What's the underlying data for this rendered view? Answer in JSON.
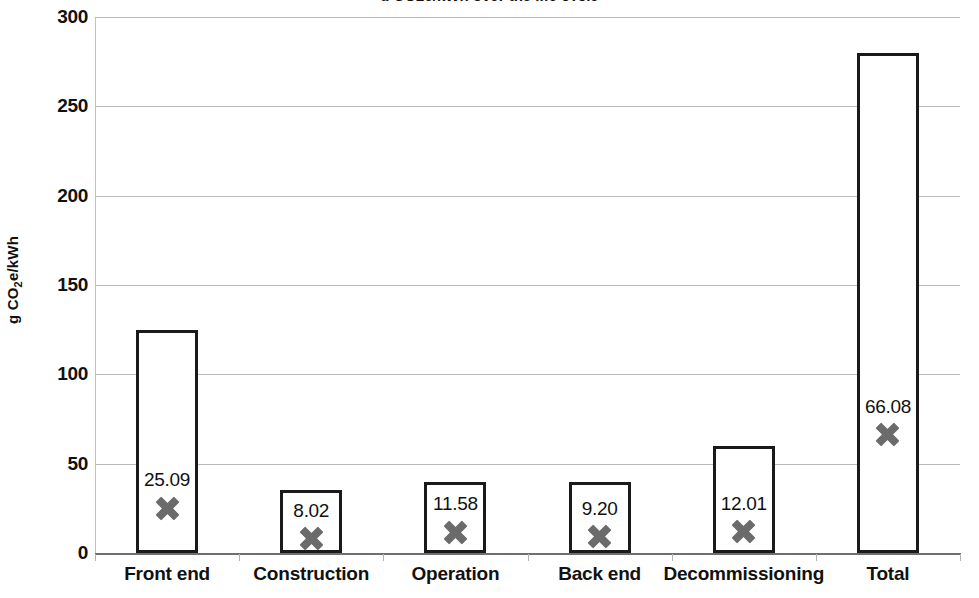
{
  "chart_data": {
    "type": "bar",
    "title": "g CO2e/kWh over the life cycle",
    "title_visible": false,
    "categories": [
      "Front end",
      "Construction",
      "Operation",
      "Back end",
      "Decommissioning",
      "Total"
    ],
    "series": [
      {
        "name": "Range upper bound",
        "type": "bar",
        "values": [
          125.0,
          35.0,
          40.0,
          40.0,
          60.0,
          280.0
        ]
      },
      {
        "name": "Mean value",
        "type": "scatter",
        "marker": "x-cross",
        "values": [
          25.09,
          8.02,
          11.58,
          9.2,
          12.01,
          66.08
        ],
        "labels": [
          "25.09",
          "8.02",
          "11.58",
          "9.20",
          "12.01",
          "66.08"
        ]
      }
    ],
    "xlabel": "",
    "ylabel": "g CO2e/kWh",
    "ylabel_parts": {
      "pre": "g CO",
      "sub": "2",
      "post": "e/kWh"
    },
    "ylim": [
      0,
      300
    ],
    "yticks": [
      0,
      50,
      100,
      150,
      200,
      250,
      300
    ],
    "ytick_labels": [
      "0",
      "50",
      "100",
      "150",
      "200",
      "250",
      "300"
    ],
    "grid": true,
    "grid_axis": "y",
    "legend": false,
    "bar_fill": "#ffffff",
    "bar_stroke": "#1a1a1a",
    "marker_color": "#6b6b6b",
    "gridline_color": "#b9b9b9",
    "text_color": "#111111",
    "background": "#ffffff"
  }
}
